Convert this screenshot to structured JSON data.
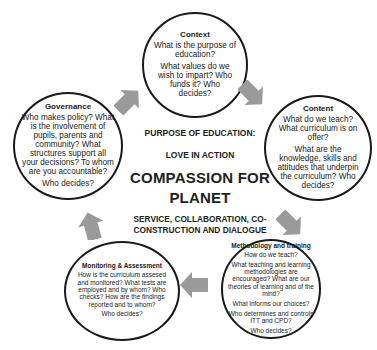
{
  "diagram": {
    "center": {
      "heading": "PURPOSE OF EDUCATION:",
      "subheading": "LOVE IN ACTION",
      "main_line1": "COMPASSION FOR",
      "main_line2": "PLANET",
      "tagline_line1": "SERVICE, COLLABORATION, CO-",
      "tagline_line2": "CONSTRUCTION AND DIALOGUE"
    },
    "nodes": [
      {
        "id": "context",
        "title": "Context",
        "questions": [
          "What is the purpose of education?",
          "What values do we wish to impart? Who funds it? Who decides?"
        ]
      },
      {
        "id": "content",
        "title": "Content",
        "questions": [
          "What do we teach? What curriculum is on offer?",
          "What are the knowledge, skills and attitudes that underpin the curriculum? Who decides?"
        ]
      },
      {
        "id": "methodology",
        "title": "Methodology and training",
        "questions": [
          "How do we teach?",
          "What teaching and learning methodologies are encouraged? What are our theories of learning and of the mind?",
          "What informs our choices?",
          "Who determines and controls ITT and CPD?",
          "Who decides?"
        ]
      },
      {
        "id": "monitoring",
        "title": "Monitoring & Assessment",
        "questions": [
          "How is the curriculum assesed and monitored? What tests are employed and by whom? Who checks? How are the findings reported and to whom?",
          "Who decides?"
        ]
      },
      {
        "id": "governance",
        "title": "Governance",
        "questions": [
          "Who makes policy? What is the involvement of pupils, parents and community? What structures support all your decisions? To whom are you accountable?",
          "Who decides?"
        ]
      }
    ],
    "arrows": [
      {
        "from": "governance",
        "to": "context",
        "direction": "up-right"
      },
      {
        "from": "context",
        "to": "content",
        "direction": "down-right"
      },
      {
        "from": "content",
        "to": "methodology",
        "direction": "down-right"
      },
      {
        "from": "methodology",
        "to": "monitoring",
        "direction": "left"
      },
      {
        "from": "monitoring",
        "to": "governance",
        "direction": "up"
      }
    ],
    "colors": {
      "arrow": "#9a9a9a",
      "circle_stroke": "#1a1a1a",
      "text": "#1a1a1a"
    }
  }
}
